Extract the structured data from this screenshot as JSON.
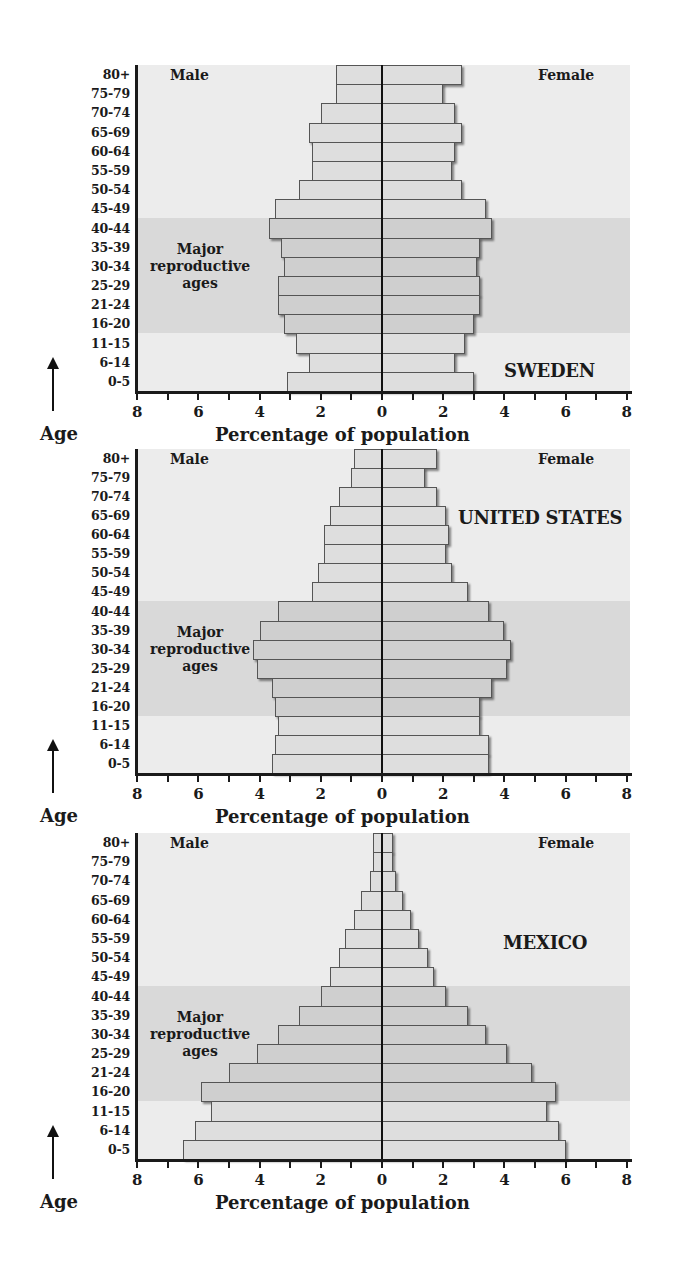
{
  "chart_data": [
    {
      "type": "bar",
      "subtype": "population-pyramid",
      "title": "SWEDEN",
      "xlabel": "Percentage of population",
      "ylabel": "Age",
      "xlim": [
        -8,
        8
      ],
      "x_tick_labels": [
        "8",
        "6",
        "4",
        "2",
        "0",
        "2",
        "4",
        "6",
        "8"
      ],
      "left_label": "Male",
      "right_label": "Female",
      "annotation": "Major reproductive ages",
      "highlight_band": [
        "16-20",
        "40-44"
      ],
      "categories": [
        "80+",
        "75-79",
        "70-74",
        "65-69",
        "60-64",
        "55-59",
        "50-54",
        "45-49",
        "40-44",
        "35-39",
        "30-34",
        "25-29",
        "21-24",
        "16-20",
        "11-15",
        "6-14",
        "0-5"
      ],
      "series": [
        {
          "name": "Male",
          "values": [
            1.5,
            1.5,
            2.0,
            2.4,
            2.3,
            2.3,
            2.7,
            3.5,
            3.7,
            3.3,
            3.2,
            3.4,
            3.4,
            3.2,
            2.8,
            2.4,
            3.1
          ]
        },
        {
          "name": "Female",
          "values": [
            2.6,
            2.0,
            2.4,
            2.6,
            2.4,
            2.3,
            2.6,
            3.4,
            3.6,
            3.2,
            3.1,
            3.2,
            3.2,
            3.0,
            2.7,
            2.4,
            3.0
          ]
        }
      ]
    },
    {
      "type": "bar",
      "subtype": "population-pyramid",
      "title": "UNITED STATES",
      "xlabel": "Percentage of population",
      "ylabel": "Age",
      "xlim": [
        -8,
        8
      ],
      "x_tick_labels": [
        "8",
        "6",
        "4",
        "2",
        "0",
        "2",
        "4",
        "6",
        "8"
      ],
      "left_label": "Male",
      "right_label": "Female",
      "annotation": "Major reproductive ages",
      "highlight_band": [
        "16-20",
        "40-44"
      ],
      "categories": [
        "80+",
        "75-79",
        "70-74",
        "65-69",
        "60-64",
        "55-59",
        "50-54",
        "45-49",
        "40-44",
        "35-39",
        "30-34",
        "25-29",
        "21-24",
        "16-20",
        "11-15",
        "6-14",
        "0-5"
      ],
      "series": [
        {
          "name": "Male",
          "values": [
            0.9,
            1.0,
            1.4,
            1.7,
            1.9,
            1.9,
            2.1,
            2.3,
            3.4,
            4.0,
            4.2,
            4.1,
            3.6,
            3.5,
            3.4,
            3.5,
            3.6
          ]
        },
        {
          "name": "Female",
          "values": [
            1.8,
            1.4,
            1.8,
            2.1,
            2.2,
            2.1,
            2.3,
            2.8,
            3.5,
            4.0,
            4.2,
            4.1,
            3.6,
            3.2,
            3.2,
            3.5,
            3.5
          ]
        }
      ]
    },
    {
      "type": "bar",
      "subtype": "population-pyramid",
      "title": "MEXICO",
      "xlabel": "Percentage of population",
      "ylabel": "Age",
      "xlim": [
        -8,
        8
      ],
      "x_tick_labels": [
        "8",
        "6",
        "4",
        "2",
        "0",
        "2",
        "4",
        "6",
        "8"
      ],
      "left_label": "Male",
      "right_label": "Female",
      "annotation": "Major reproductive ages",
      "highlight_band": [
        "16-20",
        "40-44"
      ],
      "categories": [
        "80+",
        "75-79",
        "70-74",
        "65-69",
        "60-64",
        "55-59",
        "50-54",
        "45-49",
        "40-44",
        "35-39",
        "30-34",
        "25-29",
        "21-24",
        "16-20",
        "11-15",
        "6-14",
        "0-5"
      ],
      "series": [
        {
          "name": "Male",
          "values": [
            0.3,
            0.3,
            0.4,
            0.7,
            0.9,
            1.2,
            1.4,
            1.7,
            2.0,
            2.7,
            3.4,
            4.1,
            5.0,
            5.9,
            5.6,
            6.1,
            6.5
          ]
        },
        {
          "name": "Female",
          "values": [
            0.35,
            0.35,
            0.45,
            0.7,
            0.95,
            1.2,
            1.5,
            1.7,
            2.1,
            2.8,
            3.4,
            4.1,
            4.9,
            5.7,
            5.4,
            5.8,
            6.0
          ]
        }
      ]
    }
  ],
  "pyramids": [
    {
      "country": "SWEDEN",
      "male_label": "Male",
      "female_label": "Female",
      "repro_label": [
        "Major",
        "reproductive",
        "ages"
      ],
      "age_axis_title": "Age",
      "x_axis_title": "Percentage of population"
    },
    {
      "country": "UNITED STATES",
      "male_label": "Male",
      "female_label": "Female",
      "repro_label": [
        "Major",
        "reproductive",
        "ages"
      ],
      "age_axis_title": "Age",
      "x_axis_title": "Percentage of population"
    },
    {
      "country": "MEXICO",
      "male_label": "Male",
      "female_label": "Female",
      "repro_label": [
        "Major",
        "reproductive",
        "ages"
      ],
      "age_axis_title": "Age",
      "x_axis_title": "Percentage of population"
    }
  ],
  "colors": {
    "panel_bg": "#ececec",
    "band_bg": "#d9d9d9",
    "bar_fill": "#dedede",
    "bar_fill_band": "#cfcfcf",
    "bar_border": "#555555",
    "axis": "#1a1a1a"
  }
}
